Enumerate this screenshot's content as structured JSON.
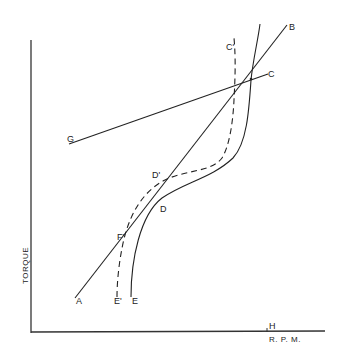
{
  "diagram": {
    "title": "",
    "axes": {
      "y_label": "TORQUE",
      "x_label": "R. P. M.",
      "x_marker": "H"
    },
    "labels": {
      "A": "A",
      "B": "B",
      "C": "C",
      "C_prime": "C'",
      "D": "D",
      "D_prime": "D'",
      "E": "E",
      "E_prime": "E'",
      "F_prime": "F'",
      "G": "G"
    },
    "curves": [
      {
        "name": "line-A-B",
        "style": "solid",
        "from": "A",
        "to": "B"
      },
      {
        "name": "line-G-C",
        "style": "solid",
        "from": "G",
        "to": "C"
      },
      {
        "name": "curve-E-D",
        "style": "solid",
        "from": "E",
        "via": "D"
      },
      {
        "name": "curve-E'-F'-D'-C'",
        "style": "dashed",
        "from": "E'",
        "via": [
          "F'",
          "D'"
        ],
        "to": "C'"
      }
    ],
    "colors": {
      "ink": "#222222",
      "background": "#ffffff"
    }
  }
}
